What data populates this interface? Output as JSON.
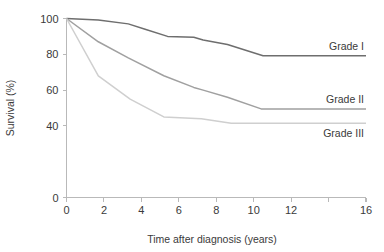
{
  "chart_data": {
    "type": "line",
    "title": "",
    "xlabel": "Time after diagnosis (years)",
    "ylabel": "Survival (%)",
    "xlim": [
      0,
      16
    ],
    "ylim": [
      0,
      100
    ],
    "grid": false,
    "legend_position": "inline-right",
    "xticks": [
      0,
      2,
      4,
      6,
      8,
      10,
      12,
      14,
      16
    ],
    "xtick_labels": [
      "0",
      "2",
      "4",
      "6",
      "8",
      "10",
      "12",
      "",
      "16"
    ],
    "yticks": [
      0,
      20,
      40,
      60,
      80,
      100
    ],
    "ytick_labels": [
      "0",
      "",
      "40",
      "60",
      "80",
      "100"
    ],
    "series": [
      {
        "name": "Grade I",
        "color": "#6e6e6e",
        "label_anchor": "above",
        "x": [
          0,
          1.7,
          3.3,
          4.2,
          5.4,
          6.8,
          7.3,
          8.6,
          10.5,
          16
        ],
        "y": [
          100,
          99.2,
          97.0,
          94.0,
          90.0,
          89.5,
          88.0,
          85.5,
          79.2,
          79.2
        ]
      },
      {
        "name": "Grade II",
        "color": "#a0a0a0",
        "label_anchor": "above",
        "x": [
          0,
          1.7,
          3.3,
          5.2,
          6.8,
          7.3,
          8.6,
          10.4,
          16
        ],
        "y": [
          100,
          87.0,
          78.0,
          68.0,
          61.5,
          60.0,
          56.0,
          49.5,
          49.5
        ]
      },
      {
        "name": "Grade III",
        "color": "#cfcfcf",
        "label_anchor": "below",
        "x": [
          0,
          1.7,
          3.4,
          5.2,
          7.2,
          8.8,
          16
        ],
        "y": [
          100,
          68.0,
          55.0,
          45.0,
          44.0,
          41.5,
          41.5
        ]
      }
    ]
  }
}
